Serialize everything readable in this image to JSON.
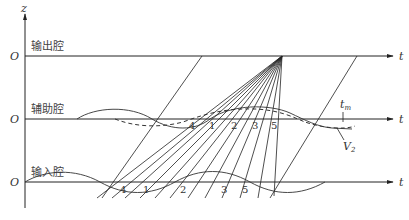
{
  "diagram": {
    "type": "applegate-diagram",
    "axis": {
      "vertical_label": "z",
      "horizontal_label": "t",
      "origin_label": "O"
    },
    "cavities": [
      {
        "label": "输出腔",
        "y": 56
      },
      {
        "label": "辅助腔",
        "y": 119
      },
      {
        "label": "输入腔",
        "y": 182
      }
    ],
    "annotations": {
      "tm": "t",
      "tm_sub": "m",
      "v2": "V",
      "v2_sub": "2"
    },
    "aux_numbers": [
      "4",
      "1",
      "2",
      "3",
      "5"
    ],
    "input_numbers": [
      "4",
      "1",
      "2",
      "3",
      "5"
    ]
  }
}
